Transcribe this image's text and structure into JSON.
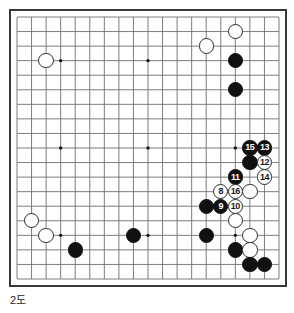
{
  "diagram": {
    "caption": "2도",
    "board_size": 19,
    "style": {
      "line_color": "#6e6e6e",
      "border_color": "#3a3a3a",
      "black_color": "#111111",
      "white_color": "#ffffff",
      "white_outline": "#2b2b2b",
      "background": "#ffffff",
      "text_color": "#1d1d1d"
    },
    "star_points": [
      {
        "col": 4,
        "row": 4
      },
      {
        "col": 10,
        "row": 4
      },
      {
        "col": 16,
        "row": 4
      },
      {
        "col": 4,
        "row": 10
      },
      {
        "col": 10,
        "row": 10
      },
      {
        "col": 16,
        "row": 10
      },
      {
        "col": 4,
        "row": 16
      },
      {
        "col": 10,
        "row": 16
      },
      {
        "col": 16,
        "row": 16
      }
    ],
    "stones": [
      {
        "col": 16,
        "row": 2,
        "color": "white",
        "label": ""
      },
      {
        "col": 14,
        "row": 3,
        "color": "white",
        "label": ""
      },
      {
        "col": 3,
        "row": 4,
        "color": "white",
        "label": ""
      },
      {
        "col": 16,
        "row": 4,
        "color": "black",
        "label": ""
      },
      {
        "col": 16,
        "row": 6,
        "color": "black",
        "label": ""
      },
      {
        "col": 17,
        "row": 10,
        "color": "black",
        "label": "15"
      },
      {
        "col": 18,
        "row": 10,
        "color": "black",
        "label": "13"
      },
      {
        "col": 17,
        "row": 11,
        "color": "black",
        "label": ""
      },
      {
        "col": 18,
        "row": 11,
        "color": "white",
        "label": "12"
      },
      {
        "col": 16,
        "row": 12,
        "color": "black",
        "label": "11"
      },
      {
        "col": 18,
        "row": 12,
        "color": "white",
        "label": "14"
      },
      {
        "col": 15,
        "row": 13,
        "color": "white",
        "label": "8"
      },
      {
        "col": 16,
        "row": 13,
        "color": "white",
        "label": "16"
      },
      {
        "col": 17,
        "row": 13,
        "color": "white",
        "label": ""
      },
      {
        "col": 14,
        "row": 14,
        "color": "black",
        "label": ""
      },
      {
        "col": 15,
        "row": 14,
        "color": "black",
        "label": "9"
      },
      {
        "col": 16,
        "row": 14,
        "color": "white",
        "label": "10"
      },
      {
        "col": 16,
        "row": 15,
        "color": "white",
        "label": ""
      },
      {
        "col": 2,
        "row": 15,
        "color": "white",
        "label": ""
      },
      {
        "col": 3,
        "row": 16,
        "color": "white",
        "label": ""
      },
      {
        "col": 9,
        "row": 16,
        "color": "black",
        "label": ""
      },
      {
        "col": 14,
        "row": 16,
        "color": "black",
        "label": ""
      },
      {
        "col": 17,
        "row": 16,
        "color": "white",
        "label": ""
      },
      {
        "col": 5,
        "row": 17,
        "color": "black",
        "label": ""
      },
      {
        "col": 16,
        "row": 17,
        "color": "black",
        "label": ""
      },
      {
        "col": 17,
        "row": 17,
        "color": "white",
        "label": ""
      },
      {
        "col": 17,
        "row": 18,
        "color": "black",
        "label": ""
      },
      {
        "col": 18,
        "row": 18,
        "color": "black",
        "label": ""
      }
    ]
  }
}
